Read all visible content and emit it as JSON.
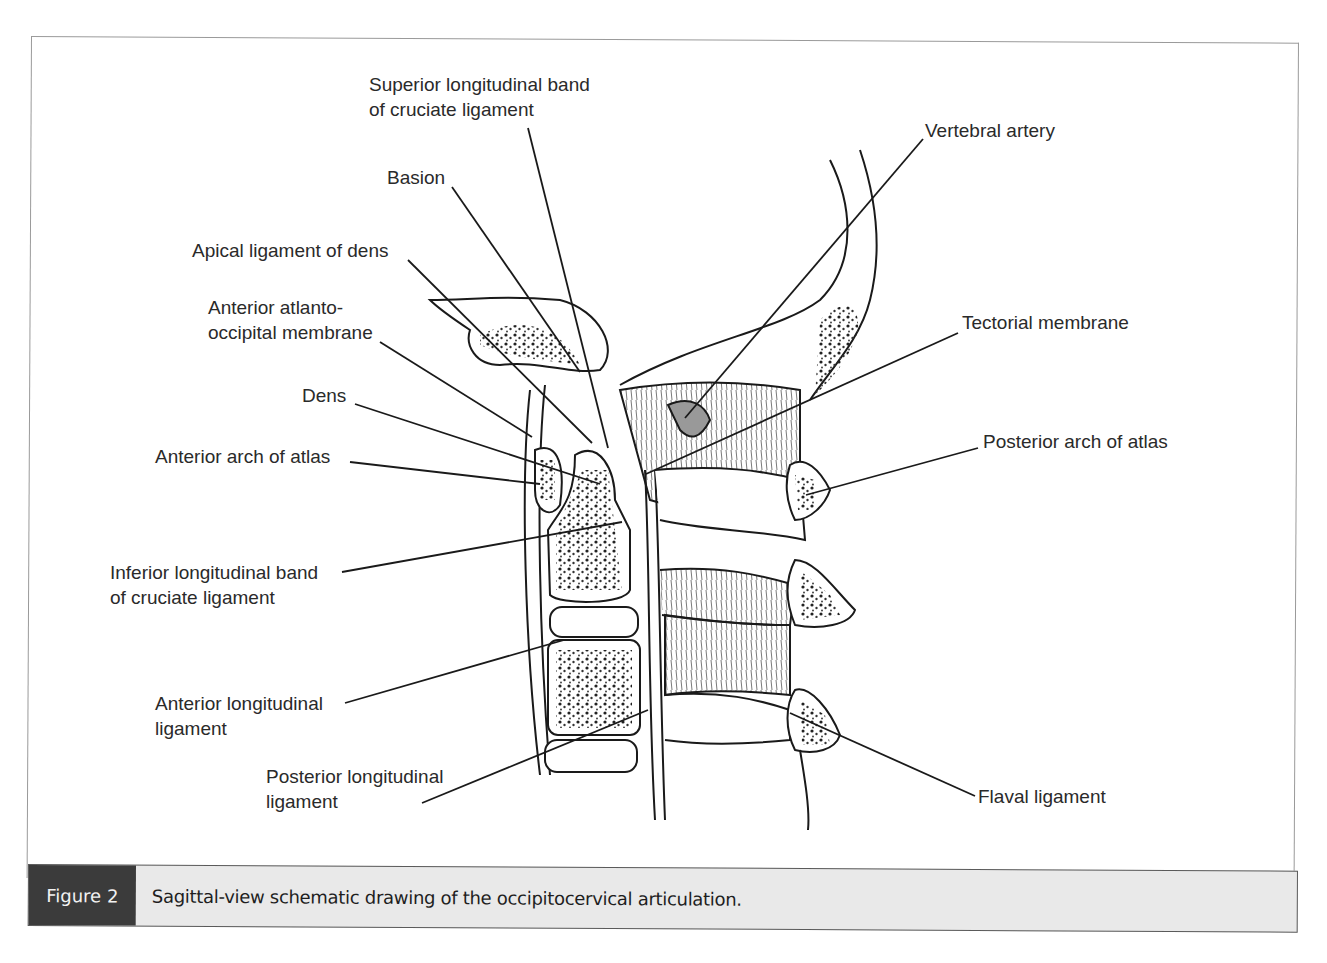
{
  "figure": {
    "number_label": "Figure 2",
    "caption": "Sagittal-view schematic drawing of the occipitocervical articulation.",
    "colors": {
      "caption_tag_bg": "#3b3b3b",
      "caption_bg": "#e9e9e9",
      "line": "#1a1a1a"
    }
  },
  "labels": {
    "superior_band": "Superior longitudinal band\nof cruciate ligament",
    "basion": "Basion",
    "apical_ligament": "Apical ligament of dens",
    "anterior_atlanto_occipital": "Anterior atlanto-\noccipital membrane",
    "dens": "Dens",
    "anterior_arch": "Anterior arch of atlas",
    "inferior_band": "Inferior longitudinal band\nof cruciate ligament",
    "anterior_longitudinal": "Anterior longitudinal\nligament",
    "posterior_longitudinal": "Posterior longitudinal\nligament",
    "vertebral_artery": "Vertebral artery",
    "tectorial_membrane": "Tectorial membrane",
    "posterior_arch": "Posterior arch of atlas",
    "flaval_ligament": "Flaval ligament"
  }
}
